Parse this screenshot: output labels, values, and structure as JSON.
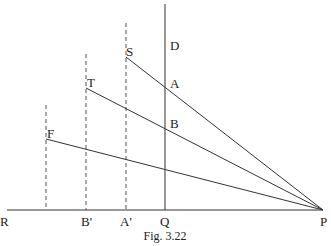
{
  "caption": "Fig. 3.22",
  "labels": {
    "R": "R",
    "B_prime": "B'",
    "A_prime": "A'",
    "Q": "Q",
    "P": "P",
    "D": "D",
    "S": "S",
    "A": "A",
    "T": "T",
    "B": "B",
    "F": "F"
  },
  "points": {
    "R": [
      7,
      210
    ],
    "P": [
      323,
      210
    ],
    "Q": [
      165,
      210
    ],
    "D_top": [
      165,
      4
    ],
    "S": [
      126,
      57
    ],
    "T": [
      86,
      88
    ],
    "F": [
      46,
      139
    ],
    "A": [
      165,
      87
    ],
    "B": [
      165,
      128
    ],
    "A_prime": [
      126,
      210
    ],
    "B_prime": [
      86,
      210
    ],
    "F_base": [
      46,
      210
    ]
  },
  "dashed_verticals": [
    {
      "x": 126,
      "y_top": 23,
      "y_bottom": 210
    },
    {
      "x": 86,
      "y_top": 54,
      "y_bottom": 210
    },
    {
      "x": 46,
      "y_top": 105,
      "y_bottom": 210
    }
  ]
}
